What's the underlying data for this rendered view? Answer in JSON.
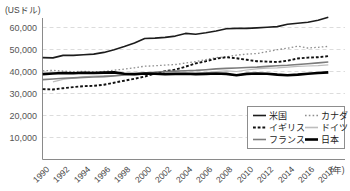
{
  "chart_data": {
    "type": "line",
    "title": "",
    "unit_label": "(USドル)",
    "x_axis_suffix": "(年)",
    "x": [
      1990,
      1991,
      1992,
      1993,
      1994,
      1995,
      1996,
      1997,
      1998,
      1999,
      2000,
      2001,
      2002,
      2003,
      2004,
      2005,
      2006,
      2007,
      2008,
      2009,
      2010,
      2011,
      2012,
      2013,
      2014,
      2015,
      2016,
      2017,
      2018
    ],
    "x_tick_labels": [
      "1990",
      "1992",
      "1994",
      "1996",
      "1998",
      "2000",
      "2002",
      "2004",
      "2006",
      "2008",
      "2010",
      "2012",
      "2014",
      "2016",
      "2018"
    ],
    "y_ticks": [
      10000,
      20000,
      30000,
      40000,
      50000,
      60000
    ],
    "y_tick_labels": [
      "10,000",
      "20,000",
      "30,000",
      "40,000",
      "50,000",
      "60,000"
    ],
    "ylim": [
      0,
      65000
    ],
    "grid": "horizontal-dashed",
    "grid_color": "#dcdcdc",
    "axis_color": "#8a8a8a",
    "legend_position": "inside-bottom-right",
    "series": [
      {
        "name": "米国",
        "color": "#1c1c1c",
        "width": 1.6,
        "dash": "",
        "values": [
          46300,
          46200,
          47300,
          47300,
          47600,
          47900,
          48700,
          49900,
          51300,
          52900,
          55000,
          55200,
          55500,
          56100,
          57300,
          56900,
          57600,
          58400,
          59400,
          59600,
          59600,
          59800,
          60100,
          60400,
          61500,
          61900,
          62400,
          63300,
          64700
        ]
      },
      {
        "name": "カナダ",
        "color": "#8f8f8f",
        "width": 1.3,
        "dash": "1.6 2.2",
        "values": [
          40300,
          40500,
          40200,
          39900,
          40100,
          39900,
          40000,
          40600,
          41100,
          41700,
          42400,
          42600,
          42900,
          43200,
          43800,
          44500,
          45400,
          46300,
          46700,
          47400,
          47900,
          48200,
          49000,
          49900,
          50600,
          51500,
          50700,
          51000,
          51400
        ]
      },
      {
        "name": "イギリス",
        "color": "#111111",
        "width": 1.9,
        "dash": "2.8 1.9",
        "values": [
          32000,
          31800,
          32400,
          32900,
          33300,
          33500,
          34000,
          34900,
          35800,
          36700,
          37700,
          39100,
          40200,
          40800,
          42200,
          43700,
          44700,
          45800,
          46500,
          46000,
          45300,
          44700,
          44500,
          44300,
          44900,
          45900,
          46300,
          46500,
          47000
        ]
      },
      {
        "name": "ドイツ",
        "color": "#bdbdbd",
        "width": 1.2,
        "dash": "",
        "values": [
          null,
          35300,
          36400,
          37000,
          37600,
          37900,
          38100,
          38200,
          38300,
          38500,
          38800,
          38900,
          39000,
          39100,
          39200,
          39300,
          39500,
          39900,
          40300,
          40000,
          40700,
          41200,
          41500,
          41700,
          42000,
          42300,
          42500,
          42700,
          43000
        ]
      },
      {
        "name": "フランス",
        "color": "#7c7c7c",
        "width": 1.6,
        "dash": "",
        "values": [
          36300,
          36600,
          36900,
          37100,
          37300,
          37500,
          37700,
          38000,
          38400,
          38800,
          39300,
          39700,
          40000,
          40200,
          40300,
          40500,
          40800,
          41200,
          41400,
          41600,
          41800,
          42000,
          42300,
          42600,
          42800,
          43200,
          43500,
          43900,
          44300
        ]
      },
      {
        "name": "日本",
        "color": "#000000",
        "width": 2.6,
        "dash": "",
        "values": [
          38800,
          39100,
          39300,
          39200,
          39400,
          39300,
          39500,
          39600,
          39000,
          38800,
          39100,
          39000,
          38800,
          38900,
          39000,
          38800,
          38900,
          39100,
          38900,
          38300,
          38900,
          39100,
          39000,
          38600,
          38300,
          38600,
          39000,
          39300,
          39600
        ]
      }
    ]
  }
}
